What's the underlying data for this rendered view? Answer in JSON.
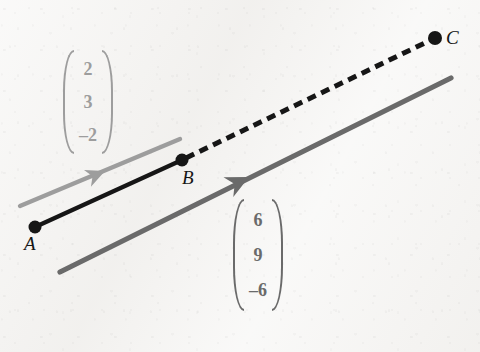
{
  "figure": {
    "background_color": "#f4f3f1",
    "width": 480,
    "height": 352
  },
  "points": [
    {
      "id": "A",
      "label": "A",
      "x": 35,
      "y": 227,
      "label_x": 24,
      "label_y": 234,
      "color": "#161616",
      "radius": 6.5
    },
    {
      "id": "B",
      "label": "B",
      "x": 182,
      "y": 160,
      "label_x": 182,
      "label_y": 168,
      "color": "#161616",
      "radius": 6.5
    },
    {
      "id": "C",
      "label": "C",
      "x": 435,
      "y": 38,
      "label_x": 446,
      "label_y": 28,
      "color": "#161616",
      "radius": 7.0
    }
  ],
  "segments": [
    {
      "id": "AB",
      "name": "segment-a-b",
      "style": "solid",
      "color": "#161616",
      "width": 4.2,
      "from": {
        "x": 35,
        "y": 227
      },
      "to": {
        "x": 182,
        "y": 160
      }
    },
    {
      "id": "BC",
      "name": "segment-b-c",
      "style": "dashed",
      "color": "#161616",
      "width": 5.0,
      "dash": "9 6",
      "from": {
        "x": 186,
        "y": 158
      },
      "to": {
        "x": 431,
        "y": 40
      }
    }
  ],
  "vector_arrows": [
    {
      "id": "arrow-ab",
      "name": "vector-arrow-ab",
      "color": "#9d9d9d",
      "width": 4.4,
      "from": {
        "x": 20,
        "y": 206
      },
      "to": {
        "x": 180,
        "y": 139
      },
      "head_at": {
        "x": 105,
        "y": 171
      }
    },
    {
      "id": "arrow-ac",
      "name": "vector-arrow-ac",
      "color": "#6a6a6a",
      "width": 5.2,
      "from": {
        "x": 60,
        "y": 272
      },
      "to": {
        "x": 451,
        "y": 78
      },
      "head_at": {
        "x": 249,
        "y": 177
      }
    }
  ],
  "vectors": [
    {
      "id": "vec-ab",
      "name": "vector-label-ab",
      "components": [
        "2",
        "3",
        "–2"
      ],
      "color": "#9d9d9d",
      "x": 62,
      "y": 50,
      "width": 52,
      "height": 104
    },
    {
      "id": "vec-ac",
      "name": "vector-label-ac",
      "components": [
        "6",
        "9",
        "–6"
      ],
      "color": "#6a6a6a",
      "x": 229,
      "y": 199,
      "width": 58,
      "height": 112
    }
  ]
}
